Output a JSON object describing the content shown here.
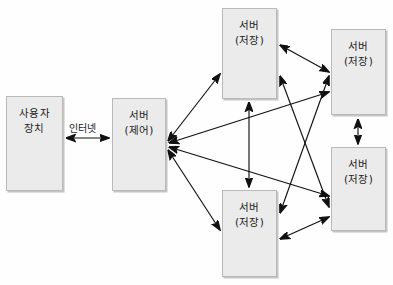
{
  "diagram": {
    "background_color": "#fefefe",
    "node_fill": "#ebebeb",
    "node_border": "#b9b9b9",
    "arrow_color": "#111111",
    "nodes": [
      {
        "id": "user-device",
        "line1": "사용자",
        "line2": "장치",
        "x": 6,
        "y": 96,
        "w": 57,
        "h": 95
      },
      {
        "id": "server-control",
        "line1": "서버",
        "line2": "(제어)",
        "x": 112,
        "y": 98,
        "w": 54,
        "h": 93
      },
      {
        "id": "server-storage-top-center",
        "line1": "서버",
        "line2": "(저장)",
        "x": 222,
        "y": 8,
        "w": 55,
        "h": 91
      },
      {
        "id": "server-storage-top-right",
        "line1": "서버",
        "line2": "(저장)",
        "x": 331,
        "y": 29,
        "w": 55,
        "h": 86
      },
      {
        "id": "server-storage-bottom-right",
        "line1": "서버",
        "line2": "(저장)",
        "x": 331,
        "y": 147,
        "w": 55,
        "h": 84
      },
      {
        "id": "server-storage-bottom-center",
        "line1": "서버",
        "line2": "(저장)",
        "x": 222,
        "y": 190,
        "w": 55,
        "h": 87
      }
    ],
    "edges": [
      {
        "id": "internet-link",
        "label": "인터넷",
        "from": "user-device",
        "to": "server-control",
        "arrows": "both"
      },
      {
        "id": "control-to-top-center",
        "from": "server-control",
        "to": "server-storage-top-center",
        "arrows": "both"
      },
      {
        "id": "control-to-top-right",
        "from": "server-control",
        "to": "server-storage-top-right",
        "arrows": "both"
      },
      {
        "id": "control-to-bottom-right",
        "from": "server-control",
        "to": "server-storage-bottom-right",
        "arrows": "both"
      },
      {
        "id": "control-to-bottom-center",
        "from": "server-control",
        "to": "server-storage-bottom-center",
        "arrows": "both"
      },
      {
        "id": "top-center-to-bottom-center",
        "from": "server-storage-top-center",
        "to": "server-storage-bottom-center",
        "arrows": "both"
      },
      {
        "id": "top-center-to-top-right",
        "from": "server-storage-top-center",
        "to": "server-storage-top-right",
        "arrows": "both"
      },
      {
        "id": "top-center-to-bottom-right",
        "from": "server-storage-top-center",
        "to": "server-storage-bottom-right",
        "arrows": "both"
      },
      {
        "id": "bottom-center-to-top-right",
        "from": "server-storage-bottom-center",
        "to": "server-storage-top-right",
        "arrows": "both"
      },
      {
        "id": "bottom-center-to-bottom-right",
        "from": "server-storage-bottom-center",
        "to": "server-storage-bottom-right",
        "arrows": "both"
      },
      {
        "id": "top-right-to-bottom-right",
        "from": "server-storage-top-right",
        "to": "server-storage-bottom-right",
        "arrows": "both"
      }
    ],
    "internet_label_position": {
      "x": 69,
      "y": 120
    }
  }
}
